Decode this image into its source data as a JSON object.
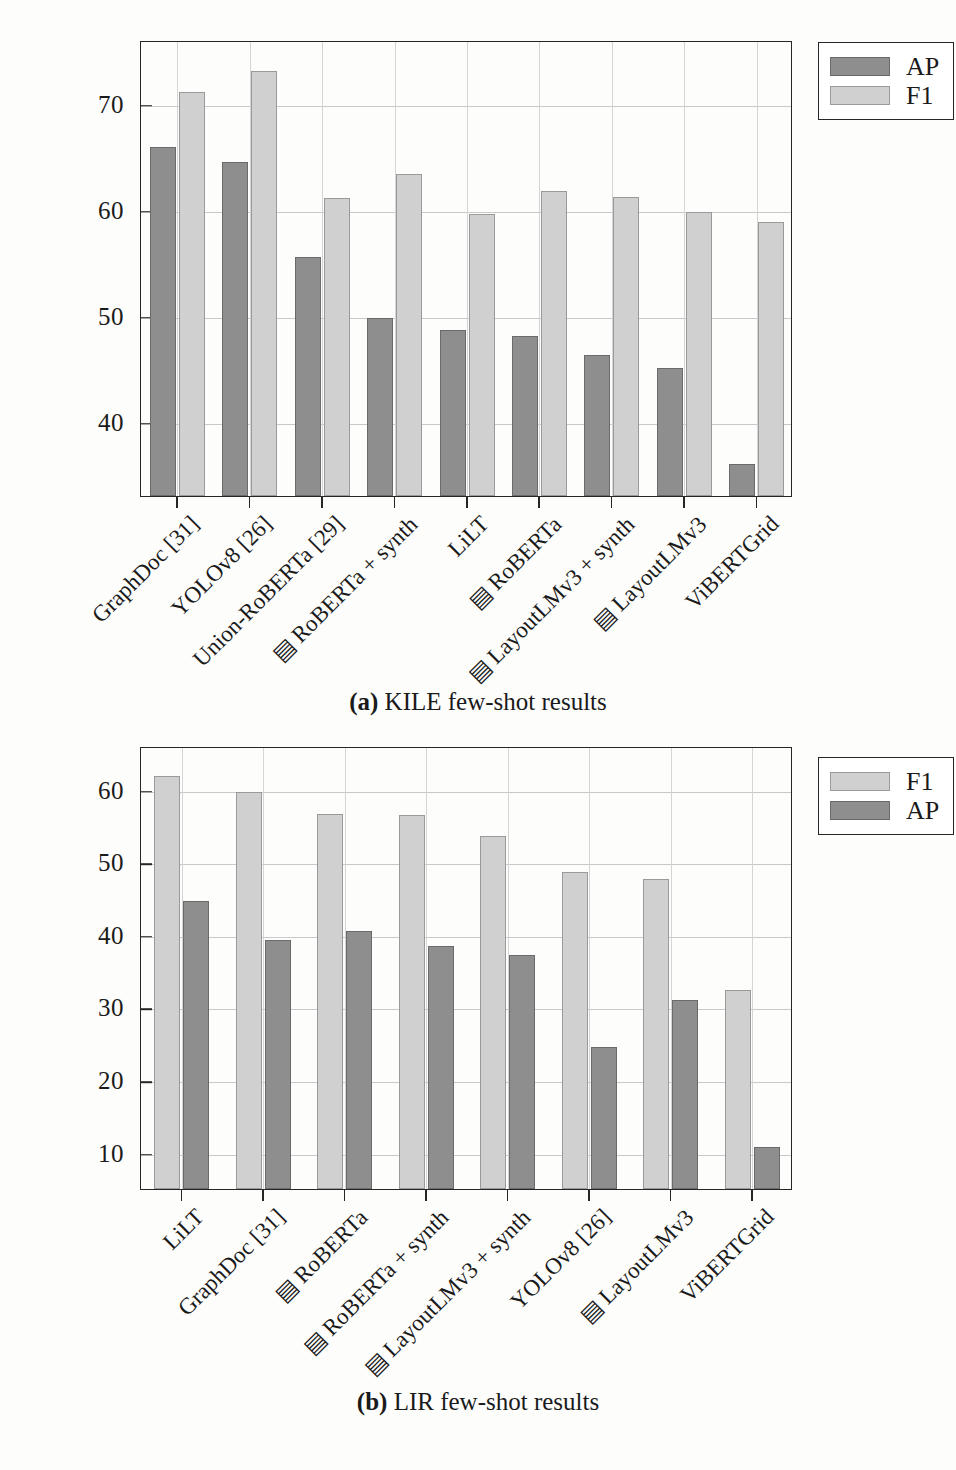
{
  "figure": {
    "charts": [
      {
        "id": "kile",
        "caption_label": "(a)",
        "caption_text": "KILE few-shot results",
        "ylabel": "AP/F1 [%]",
        "ytick_labels": [
          "70",
          "60",
          "50",
          "40"
        ],
        "legend": [
          {
            "key": "ap",
            "label": "AP",
            "color": "#8e8e8e"
          },
          {
            "key": "f1",
            "label": "F1",
            "color": "#d0d0d0"
          }
        ]
      },
      {
        "id": "lir",
        "caption_label": "(b)",
        "caption_text": "LIR few-shot results",
        "ylabel": "AP/F1 [%]",
        "ytick_labels": [
          "60",
          "50",
          "40",
          "30",
          "20",
          "10"
        ],
        "legend": [
          {
            "key": "f1",
            "label": "F1",
            "color": "#d0d0d0"
          },
          {
            "key": "ap",
            "label": "AP",
            "color": "#8e8e8e"
          }
        ]
      }
    ]
  },
  "chart_data": [
    {
      "type": "bar",
      "id": "kile",
      "title": "(a) KILE few-shot results",
      "xlabel": "",
      "ylabel": "AP/F1 [%]",
      "ylim": [
        33,
        76
      ],
      "yticks": [
        40,
        50,
        60,
        70
      ],
      "grid": true,
      "legend_position": "top-right-outside",
      "series_order": [
        "AP",
        "F1"
      ],
      "categories": [
        "GraphDoc [31]",
        "YOLOv8 [26]",
        "Union-RoBERTa [29]",
        "▤ RoBERTa + synth",
        "LiLT",
        "▤ RoBERTa",
        "▤ LayoutLMv3 + synth",
        "▤ LayoutLMv3",
        "ViBERTGrid"
      ],
      "series": [
        {
          "name": "AP",
          "color": "#8e8e8e",
          "values": [
            65.9,
            64.5,
            55.5,
            49.8,
            48.7,
            48.1,
            46.3,
            45.1,
            36.0
          ]
        },
        {
          "name": "F1",
          "color": "#d0d0d0",
          "values": [
            71.1,
            73.1,
            61.1,
            63.4,
            59.6,
            61.8,
            61.2,
            59.8,
            58.8
          ]
        }
      ]
    },
    {
      "type": "bar",
      "id": "lir",
      "title": "(b) LIR few-shot results",
      "xlabel": "",
      "ylabel": "AP/F1 [%]",
      "ylim": [
        5,
        66
      ],
      "yticks": [
        10,
        20,
        30,
        40,
        50,
        60
      ],
      "grid": true,
      "legend_position": "top-right-outside",
      "series_order": [
        "F1",
        "AP"
      ],
      "categories": [
        "LiLT",
        "GraphDoc [31]",
        "▤ RoBERTa",
        "▤ RoBERTa + synth",
        "▤ LayoutLMv3 + synth",
        "YOLOv8 [26]",
        "▤ LayoutLMv3",
        "ViBERTGrid"
      ],
      "series": [
        {
          "name": "F1",
          "color": "#d0d0d0",
          "values": [
            61.9,
            59.6,
            56.6,
            56.5,
            53.6,
            48.7,
            47.7,
            32.4
          ]
        },
        {
          "name": "AP",
          "color": "#8e8e8e",
          "values": [
            44.7,
            39.3,
            40.5,
            38.5,
            37.2,
            24.5,
            31.0,
            10.8
          ]
        }
      ]
    }
  ]
}
